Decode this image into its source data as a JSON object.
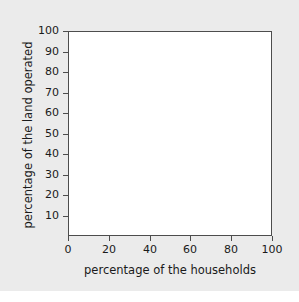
{
  "chart_data": {
    "type": "line",
    "title": "",
    "subtitle": "",
    "xlabel": "percentage of the households",
    "ylabel": "percentage of the land operated",
    "xlim": [
      0,
      100
    ],
    "ylim": [
      0,
      100
    ],
    "xticks": [
      "0",
      "20",
      "40",
      "60",
      "80",
      "100"
    ],
    "xtick_values": [
      0,
      20,
      40,
      60,
      80,
      100
    ],
    "yticks": [
      "10",
      "20",
      "30",
      "40",
      "50",
      "60",
      "70",
      "80",
      "90",
      "100"
    ],
    "ytick_values": [
      10,
      20,
      30,
      40,
      50,
      60,
      70,
      80,
      90,
      100
    ],
    "grid": false,
    "legend": null,
    "series": [],
    "annotations": [],
    "note": "empty plotting area - axes template with no plotted data"
  },
  "figure": {
    "panel_color": "#ebebeb",
    "plot_background": "#ffffff",
    "axis_color": "#4d4d4d",
    "text_color": "#1a1a1a"
  }
}
